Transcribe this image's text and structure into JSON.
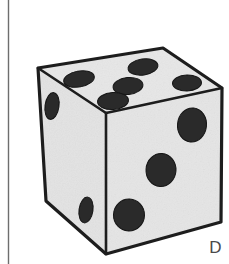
{
  "figure": {
    "kind": "line-art-illustration",
    "panel_label": "D",
    "canvas": {
      "width": 229,
      "height": 264,
      "background": "#ffffff"
    },
    "margin_rule": {
      "name": "page-margin-line",
      "orientation": "vertical",
      "x": 8.5,
      "y_start": 0,
      "y_end": 264,
      "color": "#6e6e6e",
      "stroke_width": 1.4
    },
    "style": {
      "face_fill": "#e5e5e5",
      "face_fill_top": "#e7e7e7",
      "face_fill_left": "#e3e3e3",
      "outline_color": "#1d1d1d",
      "outline_width": 3.2,
      "inner_edge_width": 2.6,
      "pip_color": "#2a2a2a",
      "pip_edge_color": "#151515"
    },
    "vertices": {
      "top_apex": [
        163,
        48
      ],
      "left_top": [
        38,
        68
      ],
      "right_top": [
        222,
        88
      ],
      "front_top": [
        106,
        113
      ],
      "left_bottom": [
        46,
        201
      ],
      "front_bottom": [
        106,
        254
      ],
      "right_bottom": [
        221,
        222
      ]
    },
    "faces": [
      {
        "name": "top-face",
        "pip_count": 5,
        "polygon": "38,68 163,48 222,88 106,113",
        "pips": [
          {
            "cx": 79,
            "cy": 79,
            "rx": 15.5,
            "ry": 8.0,
            "rot": -10
          },
          {
            "cx": 143,
            "cy": 67,
            "rx": 15.0,
            "ry": 8.0,
            "rot": -8
          },
          {
            "cx": 128,
            "cy": 86,
            "rx": 15.0,
            "ry": 8.5,
            "rot": -6
          },
          {
            "cx": 187,
            "cy": 83,
            "rx": 14.5,
            "ry": 8.0,
            "rot": -2
          },
          {
            "cx": 113,
            "cy": 101,
            "rx": 15.5,
            "ry": 8.5,
            "rot": -4
          }
        ]
      },
      {
        "name": "right-face",
        "pip_count": 3,
        "polygon": "106,113 222,88 221,222 106,254",
        "pips": [
          {
            "cx": 192,
            "cy": 125,
            "rx": 14.5,
            "ry": 17.0,
            "rot": 6
          },
          {
            "cx": 161,
            "cy": 170,
            "rx": 15.0,
            "ry": 16.5,
            "rot": 4
          },
          {
            "cx": 129,
            "cy": 215,
            "rx": 15.5,
            "ry": 16.0,
            "rot": 2
          }
        ]
      },
      {
        "name": "left-face",
        "pip_count": 2,
        "polygon": "38,68 106,113 106,254 46,201",
        "pips": [
          {
            "cx": 52,
            "cy": 106,
            "rx": 7.0,
            "ry": 13.5,
            "rot": 8
          },
          {
            "cx": 86,
            "cy": 210,
            "rx": 7.0,
            "ry": 13.0,
            "rot": 8
          }
        ]
      }
    ]
  }
}
